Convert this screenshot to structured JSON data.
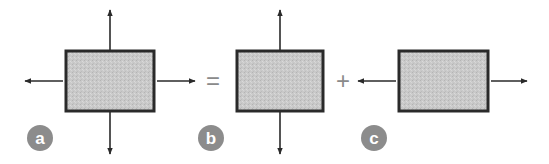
{
  "diagram": {
    "colors": {
      "box_fill": "#c8c8c8",
      "box_stroke": "#2a2a2a",
      "arrow": "#2a2a2a",
      "label_circle": "#8c8c8c",
      "label_text": "#ffffff",
      "operator": "#8a8a8a"
    },
    "operators": {
      "equals": "=",
      "plus": "+"
    },
    "panels": [
      {
        "id": "a",
        "label": "a",
        "arrows": [
          "up",
          "down",
          "left",
          "right"
        ]
      },
      {
        "id": "b",
        "label": "b",
        "arrows": [
          "up",
          "down"
        ]
      },
      {
        "id": "c",
        "label": "c",
        "arrows": [
          "left",
          "right"
        ]
      }
    ]
  }
}
